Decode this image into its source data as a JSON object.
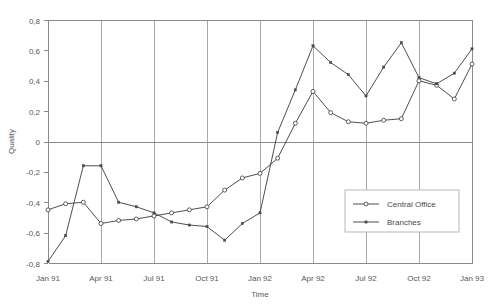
{
  "chart_data": {
    "type": "line",
    "title": "",
    "xlabel": "Time",
    "ylabel": "Quality",
    "grid": "vertical gridlines at quarter boundaries; horizontal line at y=0",
    "legend_position": "inside lower-right",
    "ylim": [
      -0.8,
      0.8
    ],
    "yticks": [
      0.8,
      0.6,
      0.4,
      0.2,
      0,
      -0.2,
      -0.4,
      -0.6,
      -0.8
    ],
    "ytick_labels": [
      "0,8",
      "0,6",
      "0,4",
      "0,2",
      "0",
      "-0,2",
      "-0,4",
      "-0,6",
      "-0,8"
    ],
    "xtick_labels": [
      "Jan 91",
      "Apr 91",
      "Jul 91",
      "Oct 91",
      "Jan 92",
      "Apr 92",
      "Jul 92",
      "Oct 92",
      "Jan 93"
    ],
    "x": [
      "Jan 91",
      "Feb 91",
      "Mar 91",
      "Apr 91",
      "May 91",
      "Jun 91",
      "Jul 91",
      "Aug 91",
      "Sep 91",
      "Oct 91",
      "Nov 91",
      "Dec 91",
      "Jan 92",
      "Feb 92",
      "Mar 92",
      "Apr 92",
      "May 92",
      "Jun 92",
      "Jul 92",
      "Aug 92",
      "Sep 92",
      "Oct 92",
      "Nov 92",
      "Dec 92",
      "Jan 93"
    ],
    "series": [
      {
        "name": "Central Office",
        "marker": "open-circle",
        "values": [
          -0.45,
          -0.41,
          -0.4,
          -0.54,
          -0.52,
          -0.51,
          -0.49,
          -0.47,
          -0.45,
          -0.43,
          -0.32,
          -0.24,
          -0.21,
          -0.11,
          0.12,
          0.33,
          0.19,
          0.13,
          0.12,
          0.14,
          0.15,
          0.4,
          0.37,
          0.28,
          0.51
        ]
      },
      {
        "name": "Branches",
        "marker": "small-dot",
        "values": [
          -0.79,
          -0.62,
          -0.16,
          -0.16,
          -0.4,
          -0.43,
          -0.47,
          -0.53,
          -0.55,
          -0.56,
          -0.65,
          -0.54,
          -0.47,
          0.06,
          0.34,
          0.63,
          0.52,
          0.44,
          0.3,
          0.49,
          0.65,
          0.42,
          0.38,
          0.45,
          0.61
        ]
      }
    ]
  },
  "legend": {
    "entries": [
      {
        "label": "Central Office"
      },
      {
        "label": "Branches"
      }
    ]
  }
}
